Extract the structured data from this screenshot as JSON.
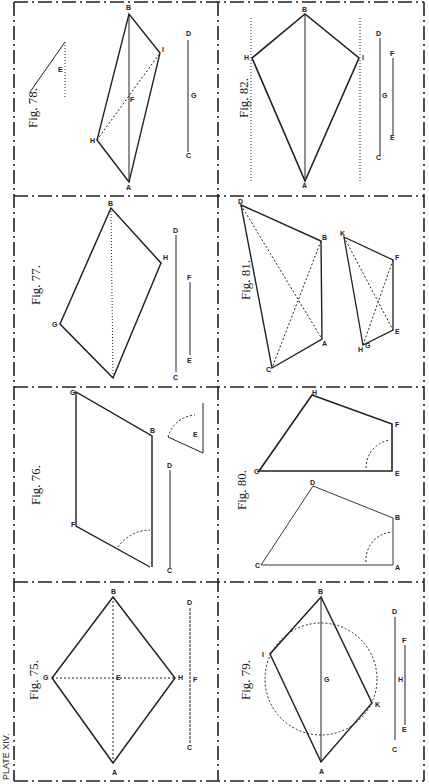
{
  "plate": {
    "title": "PLATE XIV.",
    "orientation": "rotated 90deg counter-clockwise",
    "border_style": "dash-dot",
    "ink_color": "#222222",
    "paper_color": "#ffffff"
  },
  "figures": [
    {
      "id": "fig75",
      "label": "Fig. 75.",
      "shape": "rhombus",
      "vertices": [
        "A",
        "B",
        "G",
        "H"
      ],
      "center": "E",
      "scale_line": {
        "start": "C",
        "end": "D",
        "mid": "F"
      }
    },
    {
      "id": "fig76",
      "label": "Fig. 76.",
      "shape": "parallelogram",
      "vertices": [
        "A",
        "B",
        "G",
        "F"
      ],
      "scale_line": {
        "start": "C",
        "end": "D"
      },
      "angle_label": "E"
    },
    {
      "id": "fig77",
      "label": "Fig. 77.",
      "shape": "rhomboid",
      "vertices": [
        "A",
        "B",
        "G",
        "H"
      ],
      "scale_lines": [
        {
          "start": "C",
          "end": "D"
        },
        {
          "start": "E",
          "end": "F"
        }
      ]
    },
    {
      "id": "fig78",
      "label": "Fig. 78.",
      "shape": "rhomboid",
      "vertices": [
        "A",
        "B",
        "H",
        "I"
      ],
      "center": "F",
      "scale_line": {
        "start": "C",
        "end": "D",
        "mid": "G"
      },
      "angle_label": "E"
    },
    {
      "id": "fig79",
      "label": "Fig. 79.",
      "shape": "rectangle-in-circle",
      "vertices": [
        "A",
        "B",
        "I",
        "K"
      ],
      "center": "G",
      "scale_lines": [
        {
          "start": "C",
          "end": "D",
          "mid": "H"
        },
        {
          "start": "E",
          "end": "F"
        }
      ]
    },
    {
      "id": "fig80",
      "label": "Fig. 80.",
      "shape": "trapezium-copy",
      "original": [
        "A",
        "B",
        "D",
        "C"
      ],
      "copy": [
        "E",
        "F",
        "H",
        "G"
      ]
    },
    {
      "id": "fig81",
      "label": "Fig. 81.",
      "shape": "trapezium-copy",
      "original": [
        "A",
        "B",
        "D",
        "C"
      ],
      "copy": [
        "E",
        "F",
        "K",
        "H",
        "G"
      ]
    },
    {
      "id": "fig82",
      "label": "Fig. 82.",
      "shape": "kite",
      "vertices": [
        "A",
        "B",
        "H",
        "I"
      ],
      "scale_lines": [
        {
          "start": "C",
          "end": "D",
          "mid": "G"
        },
        {
          "start": "E",
          "end": "F"
        }
      ]
    }
  ]
}
